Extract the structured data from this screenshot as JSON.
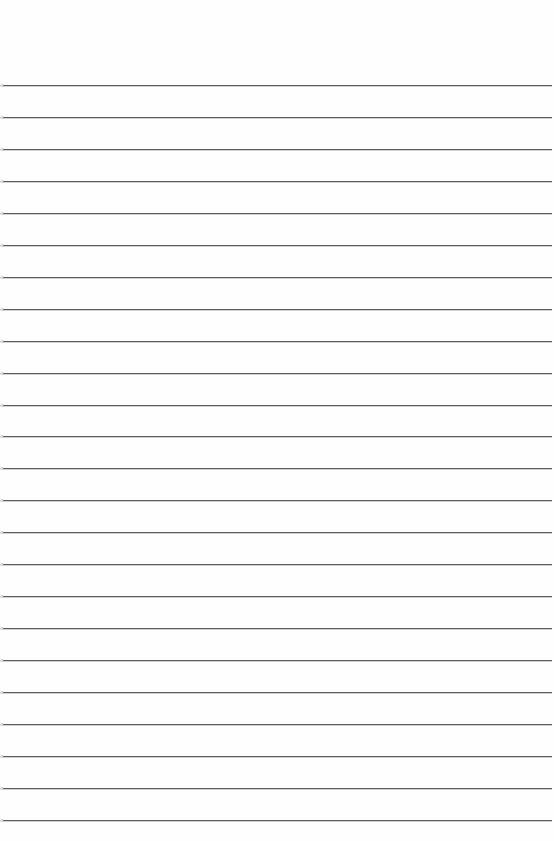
{
  "page": {
    "type": "ruled-paper",
    "background_color": "#fefefe",
    "rule_color": "#5a5a5a",
    "rule_count": 24,
    "first_rule_y": 85,
    "rule_spacing": 31.95,
    "rule_left": 3,
    "rule_right": 552
  }
}
